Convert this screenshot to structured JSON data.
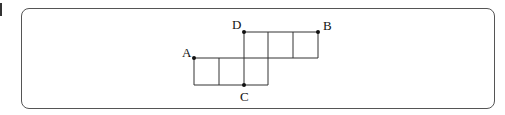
{
  "figure": {
    "grid": {
      "x": [
        194,
        219,
        244,
        268,
        293,
        318
      ],
      "y": [
        32,
        58,
        85
      ]
    },
    "points": [
      {
        "id": "A",
        "label": "A",
        "x": 194,
        "y": 58,
        "lx": 186,
        "ly": 56
      },
      {
        "id": "B",
        "label": "B",
        "x": 318,
        "y": 32,
        "lx": 327,
        "ly": 30
      },
      {
        "id": "C",
        "label": "C",
        "x": 244,
        "y": 85,
        "lx": 244,
        "ly": 101
      },
      {
        "id": "D",
        "label": "D",
        "x": 243,
        "y": 32,
        "lx": 236,
        "ly": 29
      }
    ],
    "colors": {
      "stroke": "#333333",
      "frame": "#555555"
    }
  }
}
